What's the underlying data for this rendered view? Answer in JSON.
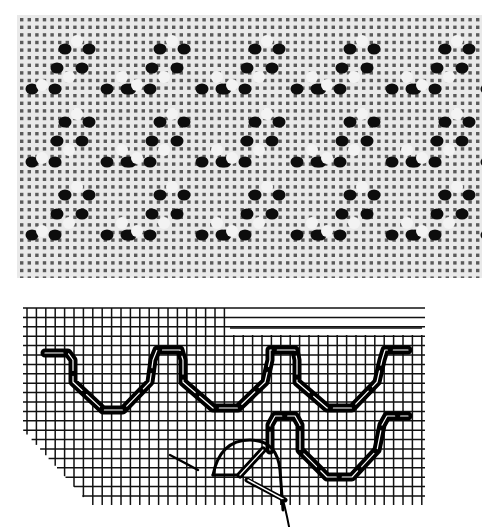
{
  "figure": {
    "photo": {
      "subject": "openwork embroidery sample on even-weave fabric",
      "pattern": "rows of triangular wave motifs with pulled-thread holes",
      "motif_rows": 3,
      "motifs_per_row": 5
    },
    "diagram": {
      "subject": "stitch diagram on grid",
      "upper_row": "continuous wave stitch with three troughs",
      "lower_row": "partial wave stitch with needle in progress",
      "colors": {
        "grid": "#111111",
        "stitch": "#000000",
        "background": "#ffffff"
      }
    }
  }
}
